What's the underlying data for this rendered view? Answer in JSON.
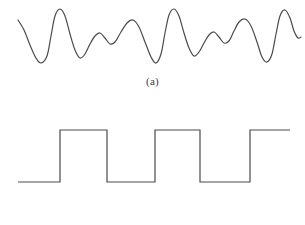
{
  "figure": {
    "background_color": "#ffffff",
    "stroke_color": "#4a4a4a",
    "stroke_width": 1.2,
    "panels": [
      {
        "id": "a",
        "caption": "(a)",
        "signal_type": "analog",
        "description": "smooth continuous quasi-periodic waveform"
      },
      {
        "id": "b",
        "caption": "(b)",
        "signal_type": "digital",
        "description": "two-level rectangular square wave"
      }
    ]
  },
  "chart_data": [
    {
      "type": "line",
      "id": "analog-waveform",
      "title": "(a)",
      "xlabel": "",
      "ylabel": "",
      "xlim": [
        0,
        305
      ],
      "ylim": [
        0,
        72
      ],
      "grid": false,
      "legend": false,
      "smooth": true,
      "series": [
        {
          "name": "analog signal",
          "color": "#4a4a4a",
          "points": [
            [
              18,
              20
            ],
            [
              24,
              30
            ],
            [
              30,
              45
            ],
            [
              36,
              58
            ],
            [
              41,
              63
            ],
            [
              47,
              56
            ],
            [
              51,
              36
            ],
            [
              55,
              16
            ],
            [
              60,
              9
            ],
            [
              65,
              16
            ],
            [
              70,
              34
            ],
            [
              75,
              50
            ],
            [
              80,
              58
            ],
            [
              85,
              54
            ],
            [
              90,
              44
            ],
            [
              95,
              36
            ],
            [
              100,
              33
            ],
            [
              105,
              38
            ],
            [
              110,
              44
            ],
            [
              115,
              42
            ],
            [
              121,
              32
            ],
            [
              127,
              23
            ],
            [
              133,
              20
            ],
            [
              139,
              27
            ],
            [
              145,
              42
            ],
            [
              151,
              57
            ],
            [
              156,
              63
            ],
            [
              161,
              54
            ],
            [
              165,
              33
            ],
            [
              169,
              15
            ],
            [
              174,
              9
            ],
            [
              179,
              16
            ],
            [
              184,
              33
            ],
            [
              189,
              48
            ],
            [
              194,
              56
            ],
            [
              199,
              52
            ],
            [
              204,
              43
            ],
            [
              209,
              35
            ],
            [
              214,
              32
            ],
            [
              219,
              37
            ],
            [
              224,
              43
            ],
            [
              229,
              41
            ],
            [
              234,
              31
            ],
            [
              239,
              22
            ],
            [
              245,
              19
            ],
            [
              251,
              26
            ],
            [
              257,
              42
            ],
            [
              262,
              57
            ],
            [
              267,
              62
            ],
            [
              272,
              54
            ],
            [
              276,
              34
            ],
            [
              280,
              16
            ],
            [
              285,
              10
            ],
            [
              290,
              18
            ],
            [
              294,
              31
            ],
            [
              298,
              38
            ],
            [
              301,
              37
            ]
          ]
        }
      ]
    },
    {
      "type": "line",
      "id": "digital-waveform",
      "title": "(b)",
      "xlabel": "",
      "ylabel": "",
      "xlim": [
        0,
        305
      ],
      "ylim": [
        0,
        113
      ],
      "grid": false,
      "legend": false,
      "smooth": false,
      "levels": {
        "low": 70,
        "high": 18
      },
      "transitions": [
        18,
        60,
        107,
        155,
        200,
        250
      ],
      "series": [
        {
          "name": "digital signal",
          "color": "#4a4a4a",
          "points": [
            [
              18,
              70
            ],
            [
              60,
              70
            ],
            [
              60,
              18
            ],
            [
              107,
              18
            ],
            [
              107,
              70
            ],
            [
              155,
              70
            ],
            [
              155,
              18
            ],
            [
              200,
              18
            ],
            [
              200,
              70
            ],
            [
              250,
              70
            ],
            [
              250,
              18
            ],
            [
              290,
              18
            ]
          ]
        }
      ]
    }
  ]
}
